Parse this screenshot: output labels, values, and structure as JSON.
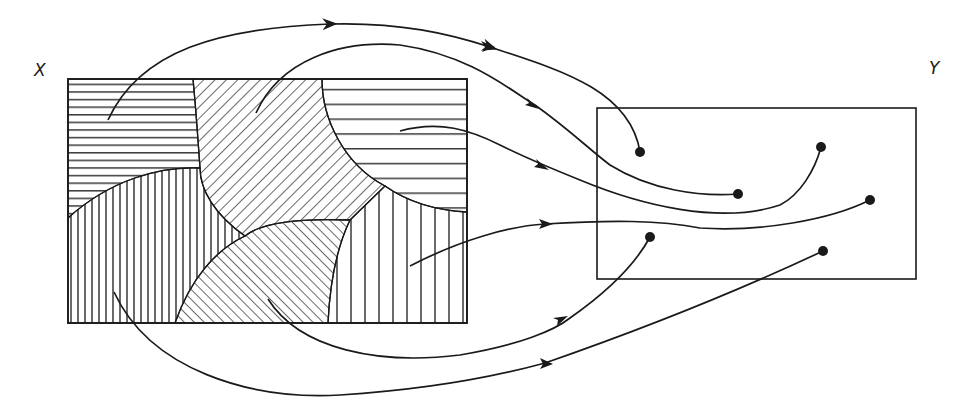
{
  "labels": {
    "domain_set": "X",
    "codomain_set": "Y"
  },
  "colors": {
    "ink": "#1a1a1a",
    "background": "#ffffff"
  },
  "domain_box": {
    "x": 68,
    "y": 79,
    "width": 399,
    "height": 244
  },
  "codomain_box": {
    "x": 597,
    "y": 108,
    "width": 319,
    "height": 171
  },
  "regions": [
    {
      "name": "top-left",
      "hatch": "horizontal"
    },
    {
      "name": "top-middle",
      "hatch": "diagonal-backslash"
    },
    {
      "name": "top-right",
      "hatch": "horizontal-wide"
    },
    {
      "name": "bottom-left",
      "hatch": "vertical"
    },
    {
      "name": "bottom-middle",
      "hatch": "diagonal-slash"
    },
    {
      "name": "bottom-right",
      "hatch": "vertical-wide"
    }
  ],
  "mappings": [
    {
      "from_region": "top-left",
      "start": [
        108,
        120
      ],
      "end": [
        640,
        152
      ]
    },
    {
      "from_region": "top-middle",
      "start": [
        256,
        113
      ],
      "end": [
        738,
        194
      ]
    },
    {
      "from_region": "top-right",
      "start": [
        400,
        131
      ],
      "end": [
        821,
        147
      ]
    },
    {
      "from_region": "bottom-right",
      "start": [
        410,
        266
      ],
      "end": [
        870,
        200
      ]
    },
    {
      "from_region": "bottom-middle",
      "start": [
        268,
        299
      ],
      "end": [
        650,
        237
      ]
    },
    {
      "from_region": "bottom-left",
      "start": [
        114,
        292
      ],
      "end": [
        823,
        251
      ]
    }
  ]
}
